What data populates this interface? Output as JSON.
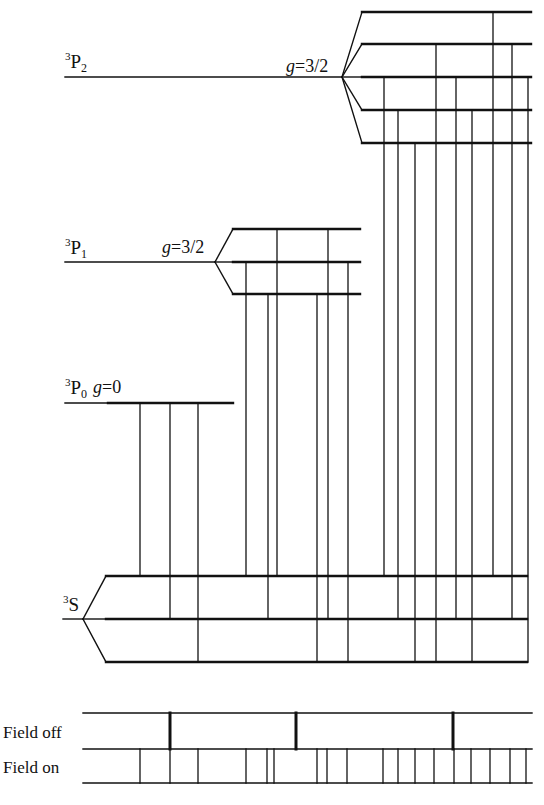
{
  "colors": {
    "ink": "#111111",
    "background": "#ffffff"
  },
  "terms": [
    {
      "id": "3P2",
      "sup": "3",
      "letter": "P",
      "sub": "2",
      "g_label": "g=3/2",
      "label_pos": [
        65,
        68
      ],
      "g_pos": [
        286,
        72
      ],
      "unperturbed": {
        "x1": 65,
        "x2": 342,
        "y": 77
      },
      "vertex_x": 342,
      "split_x1": 362,
      "split_x2": 531,
      "levels_y": [
        12,
        44,
        77,
        110,
        143
      ]
    },
    {
      "id": "3P1",
      "sup": "3",
      "letter": "P",
      "sub": "1",
      "g_label": "g=3/2",
      "label_pos": [
        65,
        254
      ],
      "g_pos": [
        162,
        253
      ],
      "unperturbed": {
        "x1": 65,
        "x2": 215,
        "y": 262
      },
      "vertex_x": 215,
      "split_x1": 233,
      "split_x2": 360,
      "levels_y": [
        229,
        262,
        294
      ]
    },
    {
      "id": "3P0",
      "sup": "3",
      "letter": "P",
      "sub": "0",
      "g_label": "g=0",
      "label_pos": [
        65,
        394
      ],
      "g_pos": [
        93,
        393
      ],
      "unperturbed": {
        "x1": 65,
        "x2": 108,
        "y": 403
      },
      "vertex_x": null,
      "split_x1": 108,
      "split_x2": 233,
      "levels_y": [
        403
      ]
    },
    {
      "id": "3S",
      "sup": "3",
      "letter": "S",
      "sub": "",
      "g_label": "",
      "label_pos": [
        63,
        611
      ],
      "g_pos": null,
      "unperturbed": {
        "x1": 63,
        "x2": 83,
        "y": 619
      },
      "vertex_x": 83,
      "split_x1": 106,
      "split_x2": 527,
      "levels_y": [
        576,
        619,
        662
      ]
    }
  ],
  "transitions": [
    {
      "x": 140,
      "from_y": 403,
      "to_y": 576
    },
    {
      "x": 170,
      "from_y": 403,
      "to_y": 619
    },
    {
      "x": 198,
      "from_y": 403,
      "to_y": 662
    },
    {
      "x": 246,
      "from_y": 262,
      "to_y": 576
    },
    {
      "x": 268,
      "from_y": 294,
      "to_y": 619
    },
    {
      "x": 277,
      "from_y": 229,
      "to_y": 576
    },
    {
      "x": 317,
      "from_y": 294,
      "to_y": 662
    },
    {
      "x": 328,
      "from_y": 229,
      "to_y": 619
    },
    {
      "x": 348,
      "from_y": 262,
      "to_y": 662
    },
    {
      "x": 384,
      "from_y": 77,
      "to_y": 576
    },
    {
      "x": 398,
      "from_y": 110,
      "to_y": 619
    },
    {
      "x": 415,
      "from_y": 143,
      "to_y": 662
    },
    {
      "x": 436,
      "from_y": 44,
      "to_y": 662
    },
    {
      "x": 456,
      "from_y": 77,
      "to_y": 619
    },
    {
      "x": 472,
      "from_y": 110,
      "to_y": 662
    },
    {
      "x": 493,
      "from_y": 12,
      "to_y": 576
    },
    {
      "x": 512,
      "from_y": 44,
      "to_y": 619
    },
    {
      "x": 528,
      "from_y": 77,
      "to_y": 662
    }
  ],
  "spectrum": {
    "field_off_label": "Field off",
    "field_on_label": "Field on",
    "x1": 83,
    "x2": 532,
    "rail_y": [
      713,
      749,
      783
    ],
    "field_off_lines_x": [
      170,
      296,
      453
    ],
    "field_on_lines_x": [
      140,
      170,
      198,
      246,
      267,
      274,
      317,
      327,
      347,
      383,
      398,
      415,
      434,
      454,
      471,
      490,
      510,
      526
    ]
  }
}
